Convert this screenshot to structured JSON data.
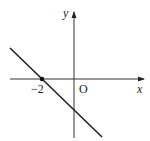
{
  "diagram": {
    "type": "coordinate-plane-line",
    "labels": {
      "x_axis": "x",
      "y_axis": "y",
      "origin": "O",
      "x_intercept": "−2"
    },
    "line": {
      "description": "decreasing line through (-2, 0) crossing negative y-axis",
      "x_intercept": -2
    },
    "colors": {
      "stroke": "#222222",
      "background": "#ffffff"
    }
  }
}
